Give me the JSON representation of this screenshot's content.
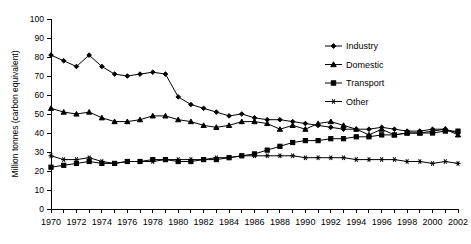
{
  "chart_data": {
    "type": "line",
    "title": "",
    "xlabel": "",
    "ylabel": "Million tonnes (carbon equivalent)",
    "ylim": [
      0,
      100
    ],
    "ytick_step": 10,
    "yticks": [
      0,
      10,
      20,
      30,
      40,
      50,
      60,
      70,
      80,
      90,
      100
    ],
    "xlim": [
      1970,
      2002
    ],
    "x": [
      1970,
      1971,
      1972,
      1973,
      1974,
      1975,
      1976,
      1977,
      1978,
      1979,
      1980,
      1981,
      1982,
      1983,
      1984,
      1985,
      1986,
      1987,
      1988,
      1989,
      1990,
      1991,
      1992,
      1993,
      1994,
      1995,
      1996,
      1997,
      1998,
      1999,
      2000,
      2001,
      2002
    ],
    "xticks_labeled": [
      1970,
      1972,
      1974,
      1976,
      1978,
      1980,
      1982,
      1984,
      1986,
      1988,
      1990,
      1992,
      1994,
      1996,
      1998,
      2000,
      2002
    ],
    "grid": false,
    "legend_position": "upper-right-inside",
    "series": [
      {
        "name": "Industry",
        "marker": "diamond",
        "color": "#000000",
        "values": [
          81,
          78,
          75,
          81,
          75,
          71,
          70,
          71,
          72,
          71,
          59,
          55,
          53,
          51,
          49,
          50,
          48,
          47,
          47,
          46,
          45,
          44,
          43,
          42,
          42,
          42,
          43,
          42,
          41,
          41,
          42,
          42,
          40
        ]
      },
      {
        "name": "Domestic",
        "marker": "triangle",
        "color": "#000000",
        "values": [
          53,
          51,
          50,
          51,
          48,
          46,
          46,
          47,
          49,
          49,
          47,
          46,
          44,
          43,
          44,
          46,
          46,
          45,
          42,
          44,
          42,
          45,
          46,
          44,
          42,
          39,
          42,
          39,
          40,
          40,
          41,
          42,
          39
        ]
      },
      {
        "name": "Transport",
        "marker": "square",
        "color": "#000000",
        "values": [
          22,
          23,
          24,
          25,
          24,
          24,
          25,
          25,
          26,
          26,
          25,
          25,
          26,
          26,
          27,
          28,
          29,
          31,
          33,
          35,
          36,
          36,
          37,
          37,
          38,
          38,
          39,
          39,
          40,
          40,
          40,
          41,
          41
        ]
      },
      {
        "name": "Other",
        "marker": "asterisk",
        "color": "#000000",
        "values": [
          28,
          26,
          26,
          27,
          25,
          24,
          25,
          25,
          25,
          26,
          26,
          26,
          26,
          27,
          27,
          28,
          28,
          28,
          28,
          28,
          27,
          27,
          27,
          27,
          26,
          26,
          26,
          26,
          25,
          25,
          24,
          25,
          24
        ]
      }
    ]
  },
  "legend": {
    "items": [
      {
        "label": "Industry"
      },
      {
        "label": "Domestic"
      },
      {
        "label": "Transport"
      },
      {
        "label": "Other"
      }
    ]
  },
  "axes": {
    "y_title": "Million tonnes (carbon equivalent)"
  }
}
